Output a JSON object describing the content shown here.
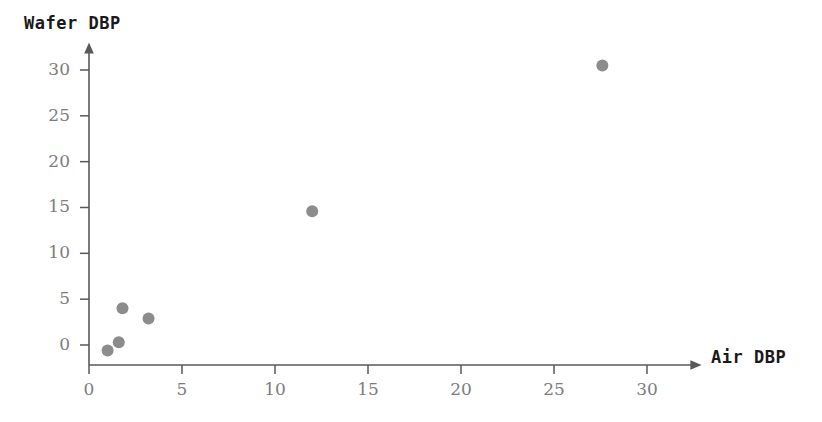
{
  "chart_data": {
    "type": "scatter",
    "title": "",
    "xlabel": "Air DBP",
    "ylabel": "Wafer DBP",
    "xlim": [
      -0.6,
      32.8
    ],
    "ylim": [
      -2.1,
      32.0
    ],
    "xticks": [
      0,
      5,
      10,
      15,
      20,
      25,
      30
    ],
    "yticks": [
      0,
      5,
      10,
      15,
      20,
      25,
      30
    ],
    "xtick_labels": [
      "0",
      "5",
      "10",
      "15",
      "20",
      "25",
      "30"
    ],
    "ytick_labels": [
      "0",
      "5",
      "10",
      "15",
      "20",
      "25",
      "30"
    ],
    "grid": false,
    "legend": "none",
    "marker_color": "#8c8c8c",
    "marker_size": 12,
    "axis_color": "#595959",
    "axis_style": "arrow-terminated",
    "points": [
      {
        "x": 1.0,
        "y": -0.6
      },
      {
        "x": 1.6,
        "y": 0.3
      },
      {
        "x": 1.8,
        "y": 4.0
      },
      {
        "x": 3.2,
        "y": 2.9
      },
      {
        "x": 12.0,
        "y": 14.6
      },
      {
        "x": 27.6,
        "y": 30.5
      }
    ]
  },
  "colors": {
    "background": "#ffffff",
    "marker": "#8c8c8c",
    "axis": "#595959",
    "tick_text": "#7d7d7d",
    "title_text": "#1a1a1a"
  }
}
